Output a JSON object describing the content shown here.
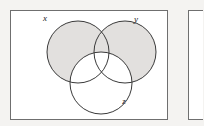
{
  "page": {
    "background_color": "#f4f3f1",
    "width": 203,
    "height": 126
  },
  "panels": [
    {
      "id": "panel-a",
      "label": "",
      "border_color": "#6f6f6f",
      "fill_color": "#ffffff",
      "x": 10,
      "y": 10,
      "width": 157,
      "height": 109,
      "clipped": false
    },
    {
      "id": "panel-b",
      "label": "",
      "border_color": "#6f6f6f",
      "fill_color": "#ffffff",
      "x": 188,
      "y": 10,
      "width": 52,
      "height": 109,
      "clipped": true
    }
  ],
  "diagram": {
    "type": "venn-3-set",
    "stroke_color": "#3a3a3a",
    "shaded_fill": "#e2e0de",
    "unshaded_fill": "#ffffff",
    "shaded_region_description": "x union y",
    "sets": [
      {
        "name": "x",
        "label": "x",
        "cx": 78,
        "cy": 52,
        "r": 31,
        "shaded": true,
        "label_x": 45,
        "label_y": 21
      },
      {
        "name": "y",
        "label": "y",
        "cx": 125,
        "cy": 52,
        "r": 31,
        "shaded": true,
        "label_x": 136,
        "label_y": 22
      },
      {
        "name": "z",
        "label": "z",
        "cx": 101,
        "cy": 83,
        "r": 31,
        "shaded": false,
        "label_x": 124,
        "label_y": 104
      }
    ]
  }
}
